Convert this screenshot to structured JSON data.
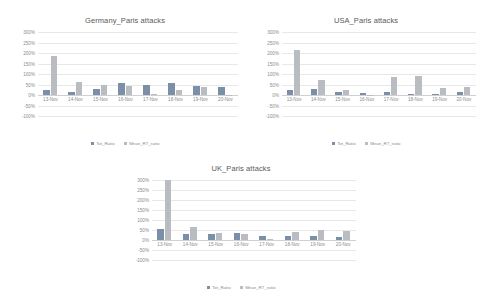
{
  "charts": [
    {
      "id": "germany",
      "title": "Germany_Paris attacks",
      "chart_data": {
        "type": "bar",
        "title": "Germany_Paris attacks",
        "xlabel": "",
        "ylabel": "",
        "ylim": [
          -100,
          300
        ],
        "yticks": [
          300,
          250,
          200,
          150,
          100,
          50,
          0,
          -50,
          -100
        ],
        "ytick_labels": [
          "300%",
          "250%",
          "200%",
          "150%",
          "100%",
          "50%",
          "0%",
          "-50%",
          "-100%"
        ],
        "grid": true,
        "legend_position": "bottom",
        "categories": [
          "13-Nov",
          "14-Nov",
          "15-Nov",
          "16-Nov",
          "17-Nov",
          "18-Nov",
          "19-Nov",
          "20-Nov"
        ],
        "series": [
          {
            "name": "Tot_Ratio",
            "color": "#7b8fa8",
            "values": [
              25,
              12,
              30,
              55,
              48,
              58,
              45,
              40
            ]
          },
          {
            "name": "Mean_RT_ratio",
            "color": "#b9bcc0",
            "values": [
              185,
              62,
              48,
              42,
              5,
              22,
              38,
              2
            ]
          }
        ]
      }
    },
    {
      "id": "usa",
      "title": "USA_Paris attacks",
      "chart_data": {
        "type": "bar",
        "title": "USA_Paris attacks",
        "xlabel": "",
        "ylabel": "",
        "ylim": [
          -100,
          300
        ],
        "yticks": [
          300,
          250,
          200,
          150,
          100,
          50,
          0,
          -50,
          -100
        ],
        "ytick_labels": [
          "300%",
          "250%",
          "200%",
          "150%",
          "100%",
          "50%",
          "0%",
          "-50%",
          "-100%"
        ],
        "grid": true,
        "legend_position": "bottom",
        "categories": [
          "13-Nov",
          "14-Nov",
          "15-Nov",
          "16-Nov",
          "17-Nov",
          "18-Nov",
          "19-Nov",
          "20-Nov"
        ],
        "series": [
          {
            "name": "Tot_Ratio",
            "color": "#7b8fa8",
            "values": [
              22,
              28,
              12,
              8,
              15,
              4,
              6,
              12
            ]
          },
          {
            "name": "Mean_RT_ratio",
            "color": "#b9bcc0",
            "values": [
              215,
              72,
              22,
              2,
              88,
              92,
              35,
              40
            ]
          }
        ]
      }
    },
    {
      "id": "uk",
      "title": "UK_Paris attacks",
      "chart_data": {
        "type": "bar",
        "title": "UK_Paris attacks",
        "xlabel": "",
        "ylabel": "",
        "ylim": [
          -100,
          300
        ],
        "yticks": [
          300,
          250,
          200,
          150,
          100,
          50,
          0,
          -50,
          -100
        ],
        "ytick_labels": [
          "300%",
          "250%",
          "200%",
          "150%",
          "100%",
          "50%",
          "0%",
          "-50%",
          "-100%"
        ],
        "grid": true,
        "legend_position": "bottom",
        "categories": [
          "13-Nov",
          "14-Nov",
          "15-Nov",
          "16-Nov",
          "17-Nov",
          "18-Nov",
          "19-Nov",
          "20-Nov"
        ],
        "series": [
          {
            "name": "Tot_Ratio",
            "color": "#7b8fa8",
            "values": [
              55,
              32,
              28,
              35,
              18,
              20,
              22,
              15
            ]
          },
          {
            "name": "Mean_RT_ratio",
            "color": "#b9bcc0",
            "values": [
              300,
              65,
              35,
              28,
              5,
              42,
              50,
              45
            ]
          }
        ]
      }
    }
  ],
  "colors": {
    "series_1": "#7b8fa8",
    "series_2": "#b9bcc0",
    "gridline": "#e8e8e8",
    "text": "#8c8c8c",
    "title_text": "#595959",
    "background": "#ffffff"
  }
}
